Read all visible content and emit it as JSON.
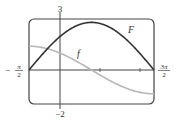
{
  "chart_data": {
    "type": "line",
    "title": "",
    "xlabel": "",
    "ylabel": "",
    "xlim": [
      "-π/2",
      "3π/2"
    ],
    "xlim_numeric": [
      -1.5708,
      4.7124
    ],
    "ylim": [
      -2,
      3
    ],
    "grid": false,
    "x_tick_labels": [
      "-π/2",
      "3π/2"
    ],
    "y_tick_labels": [
      "3",
      "-2"
    ],
    "x_ticks_unlabeled_approx": [
      1.9,
      3.9
    ],
    "series": [
      {
        "name": "F",
        "color": "#333333",
        "x": [
          -1.5708,
          -0.7854,
          0,
          0.7854,
          1.5708,
          2.3562,
          3.1416,
          3.927,
          4.7124
        ],
        "values": [
          0,
          1.07,
          1.98,
          2.59,
          2.8,
          2.59,
          1.98,
          1.07,
          0
        ]
      },
      {
        "name": "f",
        "color": "#b8b8b8",
        "x": [
          -1.5708,
          -0.7854,
          0,
          0.7854,
          1.5708,
          2.3562,
          3.1416,
          3.927,
          4.7124
        ],
        "values": [
          1.4,
          1.29,
          0.99,
          0.54,
          0,
          -0.54,
          -0.99,
          -1.29,
          -1.4
        ]
      }
    ],
    "annotations": [
      {
        "text": "F",
        "near_series": "F"
      },
      {
        "text": "f",
        "near_series": "f"
      }
    ]
  },
  "labels": {
    "x_min": "-π/2",
    "x_min_num": "π",
    "x_min_den": "2",
    "x_max_num": "3π",
    "x_max_den": "2",
    "y_max": "3",
    "y_min": "−2",
    "F_label": "F",
    "f_label": "f"
  }
}
